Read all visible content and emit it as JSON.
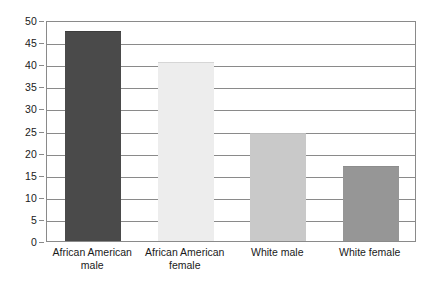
{
  "chart_data": {
    "type": "bar",
    "title": "",
    "subtitle": "",
    "xlabel": "",
    "ylabel": "",
    "ylim": [
      0,
      50
    ],
    "yticks": [
      0,
      5,
      10,
      15,
      20,
      25,
      30,
      35,
      40,
      45,
      50
    ],
    "ytick_labels": [
      "0",
      "5",
      "10",
      "15",
      "20",
      "25",
      "30",
      "35",
      "40",
      "45",
      "50"
    ],
    "grid": true,
    "legend": "none",
    "categories": [
      "African American male",
      "African American female",
      "White male",
      "White female"
    ],
    "category_lines": [
      [
        "African American",
        "male"
      ],
      [
        "African American",
        "female"
      ],
      [
        "White male",
        ""
      ],
      [
        "White female",
        ""
      ]
    ],
    "values": [
      47.5,
      40.5,
      24.5,
      17.0
    ],
    "bar_colors": [
      "#4a4a4a",
      "#ededed",
      "#c9c9c9",
      "#969696"
    ],
    "bar_border_colors": [
      "#3d3d3d",
      "#d6d6d6",
      "#bdbdbd",
      "#8d8d8d"
    ],
    "axis_color": "#8a8a8a",
    "text_color": "#1a1a1a",
    "background": "#ffffff"
  }
}
